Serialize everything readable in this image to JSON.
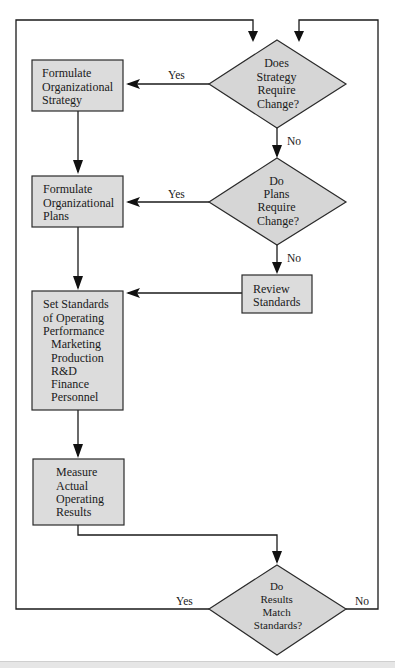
{
  "diagram": {
    "type": "flowchart",
    "nodes": {
      "strategy_decision": {
        "shape": "diamond",
        "lines": [
          "Does",
          "Strategy",
          "Require",
          "Change?"
        ]
      },
      "formulate_strategy": {
        "shape": "box",
        "lines": [
          "Formulate",
          "Organizational",
          "Strategy"
        ]
      },
      "plans_decision": {
        "shape": "diamond",
        "lines": [
          "Do",
          "Plans",
          "Require",
          "Change?"
        ]
      },
      "formulate_plans": {
        "shape": "box",
        "lines": [
          "Formulate",
          "Organizational",
          "Plans"
        ]
      },
      "review_standards": {
        "shape": "box",
        "lines": [
          "Review",
          "Standards"
        ]
      },
      "set_standards": {
        "shape": "box",
        "lines": [
          "Set Standards",
          "of Operating",
          "Performance",
          "Marketing",
          "Production",
          "R&D",
          "Finance",
          "Personnel"
        ]
      },
      "measure_results": {
        "shape": "box",
        "lines": [
          "Measure",
          "Actual",
          "Operating",
          "Results"
        ]
      },
      "results_decision": {
        "shape": "diamond",
        "lines": [
          "Do",
          "Results",
          "Match",
          "Standards?"
        ]
      }
    },
    "edge_labels": {
      "strategy_yes": "Yes",
      "strategy_no": "No",
      "plans_yes": "Yes",
      "plans_no": "No",
      "results_yes": "Yes",
      "results_no": "No"
    },
    "edges": [
      {
        "from": "strategy_decision",
        "to": "formulate_strategy",
        "label": "Yes"
      },
      {
        "from": "strategy_decision",
        "to": "plans_decision",
        "label": "No"
      },
      {
        "from": "formulate_strategy",
        "to": "formulate_plans",
        "label": ""
      },
      {
        "from": "plans_decision",
        "to": "formulate_plans",
        "label": "Yes"
      },
      {
        "from": "plans_decision",
        "to": "review_standards",
        "label": "No"
      },
      {
        "from": "formulate_plans",
        "to": "set_standards",
        "label": ""
      },
      {
        "from": "review_standards",
        "to": "set_standards",
        "label": ""
      },
      {
        "from": "set_standards",
        "to": "measure_results",
        "label": ""
      },
      {
        "from": "measure_results",
        "to": "results_decision",
        "label": ""
      },
      {
        "from": "results_decision",
        "to": "strategy_decision",
        "label": "Yes"
      },
      {
        "from": "results_decision",
        "to": "strategy_decision",
        "label": "No"
      }
    ],
    "colors": {
      "node_fill": "#dcdcdc",
      "diamond_fill": "#d6d6d6",
      "stroke": "#2a2a2a",
      "background": "#ffffff"
    }
  }
}
